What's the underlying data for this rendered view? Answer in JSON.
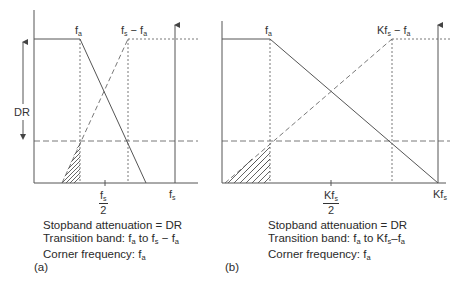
{
  "figure": {
    "panels": [
      {
        "id": "a",
        "panel_label": "(a)",
        "labels": {
          "fa": {
            "base": "f",
            "sub": "a"
          },
          "fs_minus_fa": {
            "base1": "f",
            "sub1": "s",
            "op": " − ",
            "base2": "f",
            "sub2": "a"
          },
          "dr": "DR",
          "half_fs": {
            "num_base": "f",
            "num_sub": "s",
            "den": "2"
          },
          "fs": {
            "base": "f",
            "sub": "s"
          }
        },
        "caption": {
          "line1": "Stopband attenuation = DR",
          "line2_prefix": "Transition band: ",
          "line2_a": "f",
          "line2_a_sub": "a",
          "line2_mid": " to ",
          "line2_b": "f",
          "line2_b_sub": "s",
          "line2_op": " − ",
          "line2_c": "f",
          "line2_c_sub": "a",
          "line3_prefix": "Corner frequency: ",
          "line3_f": "f",
          "line3_sub": "a"
        }
      },
      {
        "id": "b",
        "panel_label": "(b)",
        "labels": {
          "fa": {
            "base": "f",
            "sub": "a"
          },
          "kfs_minus_fa": {
            "base1": "Kf",
            "sub1": "s",
            "op": " − ",
            "base2": "f",
            "sub2": "a"
          },
          "half_kfs": {
            "num_base": "Kf",
            "num_sub": "s",
            "den": "2"
          },
          "kfs": {
            "base": "Kf",
            "sub": "s"
          }
        },
        "caption": {
          "line1": "Stopband attenuation = DR",
          "line2_prefix": "Transition band: ",
          "line2_a": "f",
          "line2_a_sub": "a",
          "line2_mid": " to ",
          "line2_b": "Kf",
          "line2_b_sub": "s",
          "line2_op": "–",
          "line2_c": "f",
          "line2_c_sub": "a",
          "line3_prefix": "Corner frequency: ",
          "line3_f": "f",
          "line3_sub": "a"
        }
      }
    ],
    "colors": {
      "line": "#555555",
      "dashed": "#777777",
      "text": "#333333"
    }
  }
}
